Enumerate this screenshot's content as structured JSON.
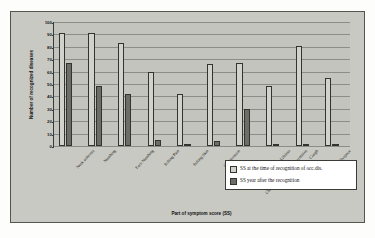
{
  "chart_data": {
    "type": "bar",
    "title": "",
    "xlabel": "Part of symptom score (SS)",
    "ylabel": "Number of recognized diseases",
    "ylim": [
      0,
      100
    ],
    "ytick_step": 10,
    "yticks": [
      0,
      10,
      20,
      30,
      40,
      50,
      60,
      70,
      80,
      90,
      100
    ],
    "grid": true,
    "legend_position": "bottom-right",
    "categories": [
      "Neck arthrosis",
      "Numbing",
      "Face Numbing",
      "Itching Pain",
      "Itching Skin",
      "Compression",
      "Chronic swelling of the extremities",
      "Lifeless",
      "Cough",
      "Dyspnoe"
    ],
    "series": [
      {
        "name": "SS at the time of recognition of occ.dis.",
        "color": "#d2d2cd",
        "values": [
          91,
          91,
          83,
          60,
          42,
          66,
          67,
          48,
          81,
          55
        ]
      },
      {
        "name": "SS year after the recognition",
        "color": "#6d6d68",
        "values": [
          67,
          48,
          42,
          5,
          2,
          4,
          30,
          2,
          1,
          0
        ]
      }
    ]
  },
  "legend": {
    "entries": [
      "SS at the time of recognition of occ.dis.",
      "SS year after the recognition"
    ]
  }
}
